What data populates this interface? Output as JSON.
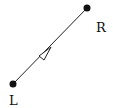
{
  "diagram": {
    "nodes": [
      {
        "id": "R",
        "label": "R",
        "x": 87,
        "y": 8
      },
      {
        "id": "L",
        "label": "L",
        "x": 13,
        "y": 84
      }
    ],
    "edges": [
      {
        "from": "L",
        "to": "R",
        "arrow": "open-triangle",
        "direction": "L-to-R"
      }
    ],
    "colors": {
      "line": "#222222",
      "node": "#111111",
      "arrow_fill": "#ffffff"
    }
  }
}
